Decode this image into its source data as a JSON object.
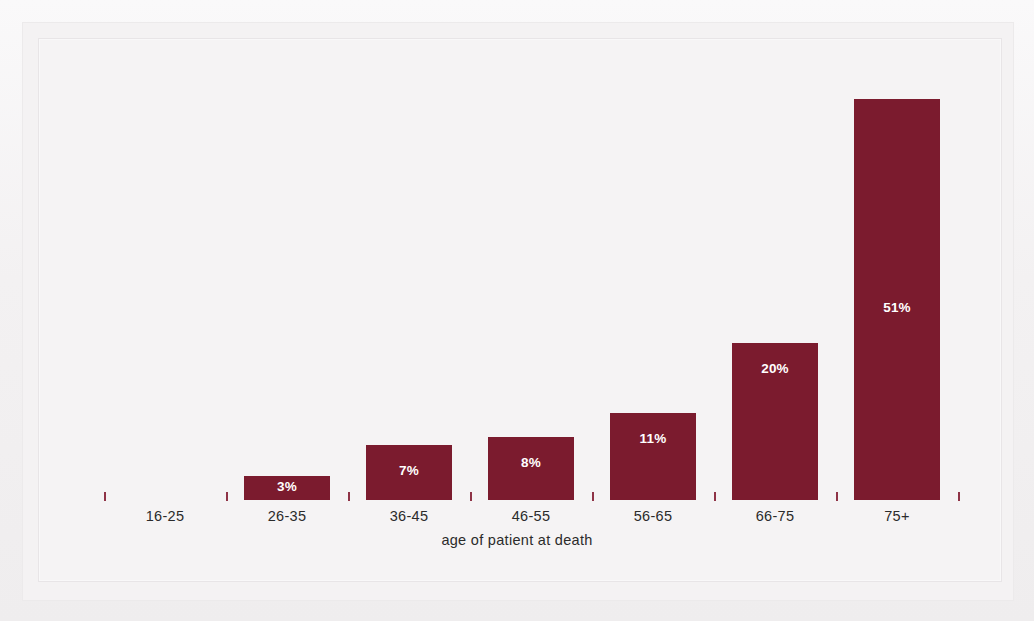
{
  "chart_data": {
    "type": "bar",
    "title": "",
    "subtitle": "",
    "xlabel": "age of patient at death",
    "ylabel": "",
    "categories": [
      "16-25",
      "26-35",
      "36-45",
      "46-55",
      "56-65",
      "66-75",
      "75+"
    ],
    "values": [
      0,
      3,
      7,
      8,
      11,
      20,
      51
    ],
    "value_labels": [
      "",
      "3%",
      "7%",
      "8%",
      "11%",
      "20%",
      "51%"
    ],
    "ylim": [
      0,
      51
    ],
    "grid": false,
    "legend": null,
    "units": "percent",
    "bar_color": "#7b1b2e",
    "label_color": "#ffffff",
    "axis_text_color": "#2b2b2b",
    "background_color": "#f4f2f3",
    "tick_color": "#8f3346",
    "tick_count": 8
  },
  "axis": {
    "title": "age of patient at death"
  }
}
